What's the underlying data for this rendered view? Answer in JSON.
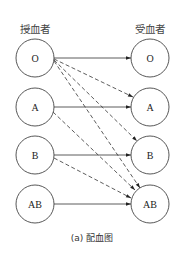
{
  "diagram": {
    "headers": {
      "donor": "授血者",
      "recipient": "受血者"
    },
    "donors": [
      {
        "id": "O",
        "label": "O"
      },
      {
        "id": "A",
        "label": "A"
      },
      {
        "id": "B",
        "label": "B"
      },
      {
        "id": "AB",
        "label": "AB"
      }
    ],
    "recipients": [
      {
        "id": "O",
        "label": "O"
      },
      {
        "id": "A",
        "label": "A"
      },
      {
        "id": "B",
        "label": "B"
      },
      {
        "id": "AB",
        "label": "AB"
      }
    ],
    "edges": [
      {
        "from": "O",
        "to": "O",
        "style": "solid"
      },
      {
        "from": "O",
        "to": "A",
        "style": "dashed"
      },
      {
        "from": "O",
        "to": "B",
        "style": "dashed"
      },
      {
        "from": "O",
        "to": "AB",
        "style": "dashed"
      },
      {
        "from": "A",
        "to": "A",
        "style": "solid"
      },
      {
        "from": "A",
        "to": "AB",
        "style": "dashed"
      },
      {
        "from": "B",
        "to": "B",
        "style": "solid"
      },
      {
        "from": "B",
        "to": "AB",
        "style": "dashed"
      },
      {
        "from": "AB",
        "to": "AB",
        "style": "solid"
      }
    ],
    "caption": "(a) 配血图"
  }
}
